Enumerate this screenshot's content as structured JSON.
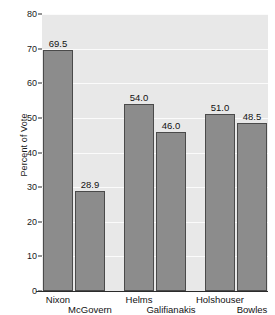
{
  "chart_data": {
    "type": "bar",
    "title": "",
    "xlabel": "",
    "ylabel": "Percent of Vote",
    "ylim": [
      0,
      80
    ],
    "ytick_step": 10,
    "yticks": [
      0,
      10,
      20,
      30,
      40,
      50,
      60,
      70,
      80
    ],
    "grid": true,
    "legend": "none",
    "categories": [
      "Nixon",
      "McGovern",
      "Helms",
      "Galifianakis",
      "Holshouser",
      "Bowles"
    ],
    "values": [
      69.5,
      28.9,
      54.0,
      46.0,
      51.0,
      48.5
    ],
    "value_labels": [
      "69.5",
      "28.9",
      "54.0",
      "46.0",
      "51.0",
      "48.5"
    ],
    "label_rows": [
      "top",
      "bottom",
      "top",
      "bottom",
      "top",
      "bottom"
    ],
    "groups": [
      {
        "name": "Nixon vs McGovern",
        "members": [
          "Nixon",
          "McGovern"
        ]
      },
      {
        "name": "Helms vs Galifianakis",
        "members": [
          "Helms",
          "Galifianakis"
        ]
      },
      {
        "name": "Holshouser vs Bowles",
        "members": [
          "Holshouser",
          "Bowles"
        ]
      }
    ]
  },
  "colors": {
    "plot_background": "#e8e8e8",
    "bar_fill": "#8c8c8c",
    "bar_outline": "#4a4a4a",
    "gridline": "#fbfbfb",
    "axis_line": "#2b2b2b",
    "text": "#121212",
    "page_background": "#ffffff"
  }
}
